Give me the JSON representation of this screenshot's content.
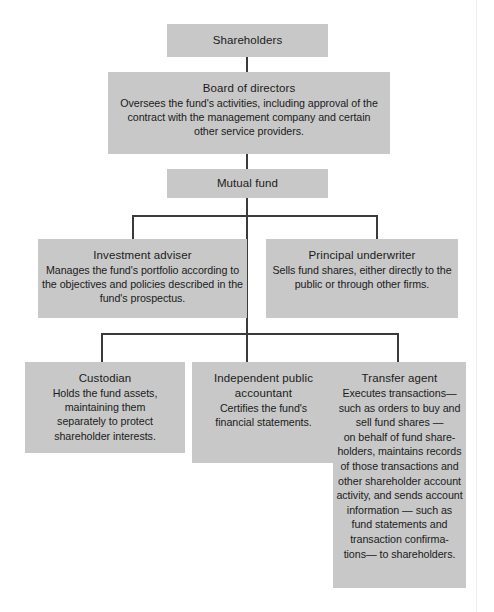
{
  "diagram": {
    "type": "organizational-chart",
    "colors": {
      "box_fill": "#c8c8c8",
      "connector": "#3a3a3a",
      "background": "#ffffff",
      "text": "#1b1b1b"
    },
    "nodes": {
      "shareholders": {
        "title": "Shareholders",
        "desc": ""
      },
      "board": {
        "title": "Board of directors",
        "desc": "Oversees the fund's activities, including approval of the\ncontract with the management company and certain\nother service providers."
      },
      "mutual_fund": {
        "title": "Mutual fund",
        "desc": ""
      },
      "investment_adviser": {
        "title": "Investment adviser",
        "desc": "Manages the fund's portfolio according to\nthe objectives and policies described in the\nfund's prospectus."
      },
      "principal_underwriter": {
        "title": "Principal underwriter",
        "desc": "Sells fund shares, either directly to the\npublic or through other firms."
      },
      "custodian": {
        "title": "Custodian",
        "desc": "Holds the fund assets,\nmaintaining them\nseparately to protect\nshareholder interests."
      },
      "independent_public_accountant": {
        "title": "Independent public\naccountant",
        "desc": "Certifies the fund's\nfinancial statements."
      },
      "transfer_agent": {
        "title": "Transfer agent",
        "desc": "Executes transactions—\nsuch as orders to buy and\nsell fund shares —\non behalf of fund share-\nholders, maintains records\nof those transactions and\nother shareholder account\nactivity, and sends account\ninformation — such as\nfund statements and\ntransaction confirma-\ntions— to shareholders."
      }
    },
    "edges": [
      {
        "from": "shareholders",
        "to": "board"
      },
      {
        "from": "board",
        "to": "mutual_fund"
      },
      {
        "from": "mutual_fund",
        "to": "investment_adviser"
      },
      {
        "from": "mutual_fund",
        "to": "principal_underwriter"
      },
      {
        "from": "mutual_fund",
        "to": "custodian"
      },
      {
        "from": "mutual_fund",
        "to": "independent_public_accountant"
      },
      {
        "from": "mutual_fund",
        "to": "transfer_agent"
      }
    ]
  }
}
